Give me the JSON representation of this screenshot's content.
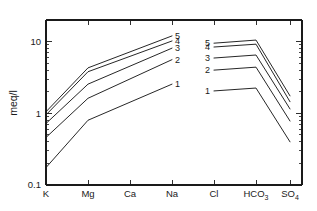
{
  "chart_data": {
    "type": "line",
    "title": "",
    "xlabel": "",
    "ylabel": "meq/l",
    "yscale": "log",
    "ylim": [
      0.1,
      20
    ],
    "grid": false,
    "legend": "inline-end-labels",
    "categories": [
      "K",
      "Mg",
      "Ca",
      "Na",
      "Cl",
      "HCO3",
      "SO4"
    ],
    "category_labels": [
      {
        "base": "K",
        "sub": ""
      },
      {
        "base": "Mg",
        "sub": ""
      },
      {
        "base": "Ca",
        "sub": ""
      },
      {
        "base": "Na",
        "sub": ""
      },
      {
        "base": "Cl",
        "sub": ""
      },
      {
        "base": "HCO",
        "sub": "3"
      },
      {
        "base": "SO",
        "sub": "4"
      }
    ],
    "ytick_labels": [
      "10",
      "1",
      "0.1"
    ],
    "ytick_values": [
      10,
      1,
      0.1
    ],
    "series": [
      {
        "name": "5",
        "label": "5",
        "left": {
          "x": [
            "K",
            "Mg",
            "Na"
          ],
          "values": [
            1.05,
            4.3,
            12.0
          ]
        },
        "right": {
          "x": [
            "Cl",
            "HCO3",
            "SO4"
          ],
          "values": [
            9.5,
            10.5,
            1.75
          ]
        }
      },
      {
        "name": "4",
        "label": "4",
        "left": {
          "x": [
            "K",
            "Mg",
            "Na"
          ],
          "values": [
            0.95,
            3.8,
            10.2
          ]
        },
        "right": {
          "x": [
            "Cl",
            "HCO3",
            "SO4"
          ],
          "values": [
            8.4,
            9.2,
            1.45
          ]
        }
      },
      {
        "name": "3",
        "label": "3",
        "left": {
          "x": [
            "K",
            "Mg",
            "Na"
          ],
          "values": [
            0.72,
            2.55,
            8.1
          ]
        },
        "right": {
          "x": [
            "Cl",
            "HCO3",
            "SO4"
          ],
          "values": [
            5.9,
            6.5,
            1.15
          ]
        }
      },
      {
        "name": "2",
        "label": "2",
        "left": {
          "x": [
            "K",
            "Mg",
            "Na"
          ],
          "values": [
            0.46,
            1.62,
            5.6
          ]
        },
        "right": {
          "x": [
            "Cl",
            "HCO3",
            "SO4"
          ],
          "values": [
            4.0,
            4.4,
            0.78
          ]
        }
      },
      {
        "name": "1",
        "label": "1",
        "left": {
          "x": [
            "K",
            "Mg",
            "Na"
          ],
          "values": [
            0.175,
            0.8,
            2.55
          ]
        },
        "right": {
          "x": [
            "Cl",
            "HCO3",
            "SO4"
          ],
          "values": [
            2.05,
            2.25,
            0.4
          ]
        }
      }
    ],
    "series_labels_left": [
      "5",
      "4",
      "3",
      "2",
      "1"
    ],
    "series_labels_right": [
      "5",
      "4",
      "3",
      "2",
      "1"
    ],
    "colors": {
      "axis": "#1a1a1a",
      "line": "#1a1a1a",
      "background": "#ffffff"
    }
  }
}
